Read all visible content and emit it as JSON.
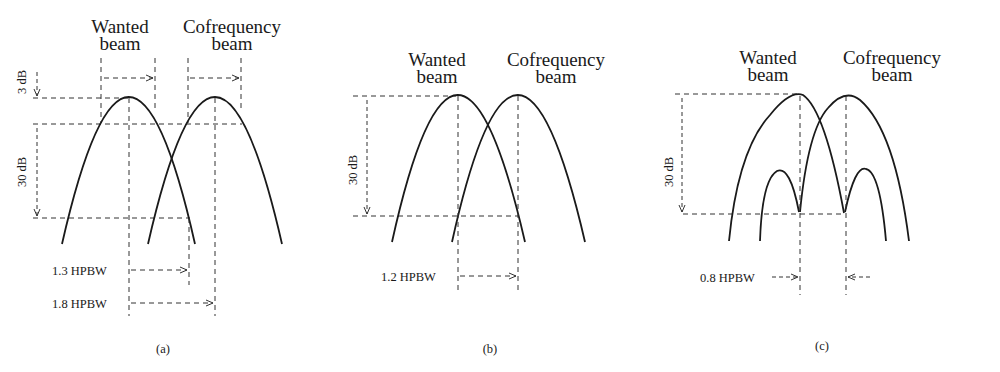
{
  "figure": {
    "panels": [
      {
        "id": "a",
        "caption": "(a)",
        "wanted_label": [
          "Wanted",
          "beam"
        ],
        "cofreq_label": [
          "Cofrequency",
          "beam"
        ],
        "level_labels": [
          "3 dB",
          "30 dB"
        ],
        "separation_labels": [
          "1.3 HPBW",
          "1.8 HPBW"
        ]
      },
      {
        "id": "b",
        "caption": "(b)",
        "wanted_label": [
          "Wanted",
          "beam"
        ],
        "cofreq_label": [
          "Cofrequency",
          "beam"
        ],
        "level_labels": [
          "30 dB"
        ],
        "separation_labels": [
          "1.2 HPBW"
        ]
      },
      {
        "id": "c",
        "caption": "(c)",
        "wanted_label": [
          "Wanted",
          "beam"
        ],
        "cofreq_label": [
          "Cofrequency",
          "beam"
        ],
        "level_labels": [
          "30 dB"
        ],
        "separation_labels": [
          "0.8 HPBW"
        ]
      }
    ]
  }
}
